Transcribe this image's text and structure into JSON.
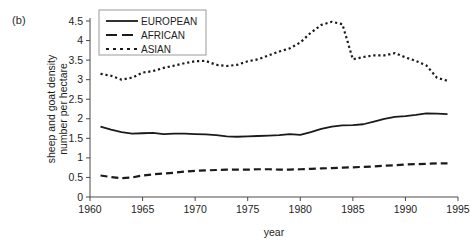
{
  "figure": {
    "panel_label": "(b)",
    "xlabel": "year",
    "ylabel_line1": "sheep and goat density",
    "ylabel_line2": "number per hectare"
  },
  "legend": {
    "position": "top-center",
    "entries": [
      {
        "label": "EUROPEAN",
        "style": "solid"
      },
      {
        "label": "AFRICAN",
        "style": "dashed"
      },
      {
        "label": "ASIAN",
        "style": "dotted"
      }
    ]
  },
  "axes": {
    "x_ticks": [
      "1960",
      "1965",
      "1970",
      "1975",
      "1980",
      "1985",
      "1990",
      "1995"
    ],
    "y_ticks": [
      "0",
      "0.5",
      "1",
      "1.5",
      "2",
      "2.5",
      "3",
      "3.5",
      "4",
      "4.5"
    ]
  },
  "chart_data": {
    "type": "line",
    "title": "",
    "subtitle": "",
    "xlabel": "year",
    "ylabel": "sheep and goat density number per hectare",
    "xlim": [
      1960,
      1995
    ],
    "ylim": [
      0,
      4.5
    ],
    "grid": false,
    "legend_position": "top-center",
    "x": [
      1961,
      1962,
      1963,
      1964,
      1965,
      1966,
      1967,
      1968,
      1969,
      1970,
      1971,
      1972,
      1973,
      1974,
      1975,
      1976,
      1977,
      1978,
      1979,
      1980,
      1981,
      1982,
      1983,
      1984,
      1985,
      1986,
      1987,
      1988,
      1989,
      1990,
      1991,
      1992,
      1993,
      1994
    ],
    "series": [
      {
        "name": "EUROPEAN",
        "style": "solid",
        "color": "#1a1a1a",
        "values": [
          1.8,
          1.72,
          1.66,
          1.62,
          1.63,
          1.64,
          1.61,
          1.62,
          1.62,
          1.61,
          1.6,
          1.58,
          1.55,
          1.54,
          1.55,
          1.56,
          1.57,
          1.58,
          1.61,
          1.59,
          1.66,
          1.74,
          1.8,
          1.83,
          1.84,
          1.86,
          1.93,
          2.0,
          2.05,
          2.07,
          2.1,
          2.14,
          2.13,
          2.12
        ]
      },
      {
        "name": "AFRICAN",
        "style": "dashed",
        "color": "#1a1a1a",
        "values": [
          0.55,
          0.51,
          0.48,
          0.5,
          0.55,
          0.58,
          0.6,
          0.62,
          0.65,
          0.67,
          0.68,
          0.69,
          0.7,
          0.7,
          0.7,
          0.71,
          0.71,
          0.7,
          0.7,
          0.71,
          0.72,
          0.73,
          0.74,
          0.75,
          0.76,
          0.77,
          0.78,
          0.8,
          0.81,
          0.83,
          0.84,
          0.85,
          0.86,
          0.86
        ]
      },
      {
        "name": "ASIAN",
        "style": "dotted",
        "color": "#1a1a1a",
        "values": [
          3.15,
          3.1,
          3.0,
          3.05,
          3.18,
          3.22,
          3.3,
          3.36,
          3.42,
          3.47,
          3.48,
          3.38,
          3.35,
          3.38,
          3.47,
          3.52,
          3.62,
          3.72,
          3.8,
          3.95,
          4.2,
          4.4,
          4.48,
          4.42,
          3.52,
          3.58,
          3.62,
          3.62,
          3.68,
          3.57,
          3.48,
          3.36,
          3.05,
          2.97
        ]
      }
    ]
  }
}
